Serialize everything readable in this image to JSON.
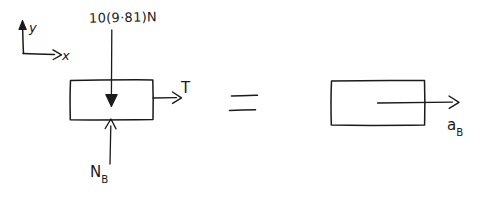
{
  "figure": {
    "ink_color": "#1a1a1a",
    "background_color": "#ffffff",
    "equals_sign": "=",
    "axes": {
      "x_label": "x",
      "y_label": "y",
      "origin_note": "axes drawn at upper left"
    },
    "free_body_diagram": {
      "block_label": "",
      "forces": [
        {
          "name": "weight",
          "label": "10(9·81)N",
          "direction": "down",
          "arrow_style": "solid-head"
        },
        {
          "name": "tension",
          "label": "T",
          "direction": "right",
          "arrow_style": "open-head"
        },
        {
          "name": "normal-force",
          "label_main": "N",
          "label_sub": "B",
          "direction": "up",
          "arrow_style": "open-head"
        }
      ]
    },
    "kinetic_diagram": {
      "block_label": "",
      "vectors": [
        {
          "name": "acceleration",
          "label_main": "a",
          "label_sub": "B",
          "direction": "right",
          "arrow_style": "open-head"
        }
      ]
    }
  }
}
